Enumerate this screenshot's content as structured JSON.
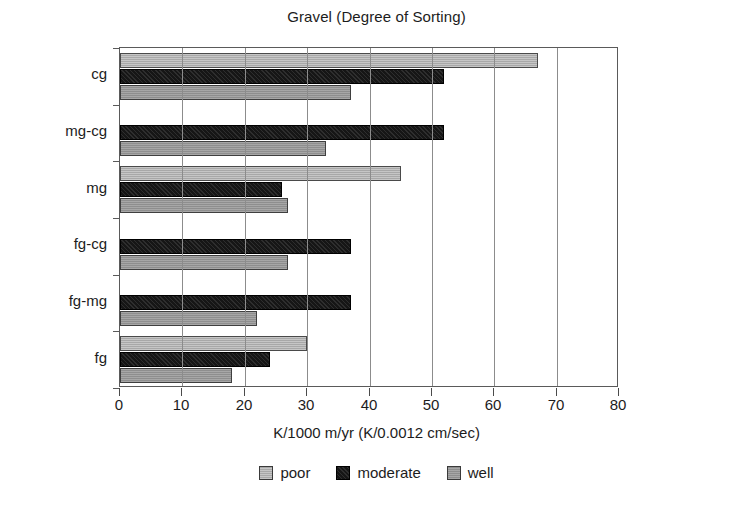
{
  "chart_data": {
    "type": "bar",
    "orientation": "horizontal",
    "title": "Gravel (Degree of Sorting)",
    "xlabel": "K/1000 m/yr (K/0.0012 cm/sec)",
    "ylabel": "",
    "xlim": [
      0,
      80
    ],
    "xticks": [
      0,
      10,
      20,
      30,
      40,
      50,
      60,
      70,
      80
    ],
    "xticklabels": [
      "0",
      "10",
      "20",
      "30",
      "40",
      "50",
      "60",
      "70",
      "80"
    ],
    "grid": "vertical",
    "legend_position": "bottom",
    "categories": [
      "fg",
      "fg-mg",
      "fg-cg",
      "mg",
      "mg-cg",
      "cg"
    ],
    "categories_top_to_bottom": [
      "cg",
      "mg-cg",
      "mg",
      "fg-cg",
      "fg-mg",
      "fg"
    ],
    "series": [
      {
        "name": "poor",
        "color": "#a8a8a8",
        "values_top_to_bottom": [
          67,
          0,
          45,
          0,
          0,
          30
        ]
      },
      {
        "name": "moderate",
        "color": "#161616",
        "values_top_to_bottom": [
          52,
          52,
          26,
          37,
          37,
          24
        ]
      },
      {
        "name": "well",
        "color": "#8e8e8e",
        "values_top_to_bottom": [
          37,
          33,
          27,
          27,
          22,
          18
        ]
      }
    ]
  },
  "legend": {
    "items": [
      {
        "label": "poor"
      },
      {
        "label": "moderate"
      },
      {
        "label": "well"
      }
    ]
  }
}
